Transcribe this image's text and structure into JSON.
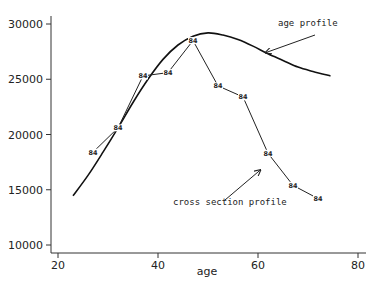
{
  "chart_data": {
    "type": "line",
    "title": "",
    "xlabel": "age",
    "ylabel": "",
    "xlim": [
      18,
      81
    ],
    "ylim": [
      9400,
      31000
    ],
    "x_ticks": [
      20,
      40,
      60,
      80
    ],
    "y_ticks": [
      10000,
      15000,
      20000,
      25000,
      30000
    ],
    "grid": false,
    "legend": "none",
    "series": [
      {
        "name": "cross section profile",
        "marker_label": "84",
        "x": [
          27,
          32,
          37,
          42,
          47,
          52,
          57,
          62,
          67,
          72
        ],
        "y": [
          18400,
          20600,
          25300,
          25600,
          28500,
          24400,
          23400,
          18300,
          15400,
          14200
        ]
      },
      {
        "name": "age profile",
        "style": "smooth curve",
        "x": [
          23,
          26,
          29,
          32,
          35,
          38,
          41,
          44,
          47,
          50,
          53,
          56,
          59,
          62,
          65,
          68,
          71,
          74.5
        ],
        "y": [
          14450,
          16300,
          18400,
          20600,
          22900,
          25000,
          26800,
          28100,
          28900,
          29200,
          29000,
          28600,
          28000,
          27300,
          26700,
          26100,
          25700,
          25300
        ]
      }
    ],
    "annotations": [
      {
        "text": "age profile",
        "text_pos": [
          64,
          29600
        ],
        "arrow_to": [
          61.5,
          27400
        ]
      },
      {
        "text": "cross section profile",
        "text_pos": [
          51,
          14900
        ],
        "arrow_to": [
          60.5,
          16800
        ]
      }
    ]
  }
}
